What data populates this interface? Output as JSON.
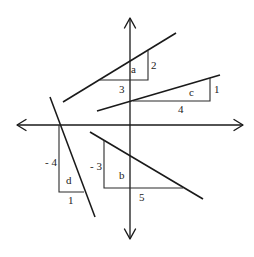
{
  "diagram": {
    "colors": {
      "stroke": "#1a1a1a",
      "text": "#222222",
      "background": "#ffffff"
    },
    "axes": {
      "x_axis": {
        "y": 125,
        "x_start": 17,
        "x_end": 243
      },
      "y_axis": {
        "x": 130,
        "y_start": 18,
        "y_end": 239
      }
    },
    "lines": [
      {
        "id": "a",
        "label": "a",
        "rise_label": "2",
        "run_label": "3",
        "start": [
          63,
          102
        ],
        "end": [
          176,
          33
        ]
      },
      {
        "id": "c",
        "label": "c",
        "rise_label": "1",
        "run_label": "4",
        "start": [
          97,
          111
        ],
        "end": [
          220,
          75
        ]
      },
      {
        "id": "d",
        "label": "d",
        "rise_label": "- 4",
        "run_label": "1",
        "start": [
          50,
          97
        ],
        "end": [
          95,
          217
        ]
      },
      {
        "id": "b",
        "label": "b",
        "rise_label": "- 3",
        "run_label": "5",
        "start": [
          90,
          132
        ],
        "end": [
          203,
          199
        ]
      }
    ]
  }
}
